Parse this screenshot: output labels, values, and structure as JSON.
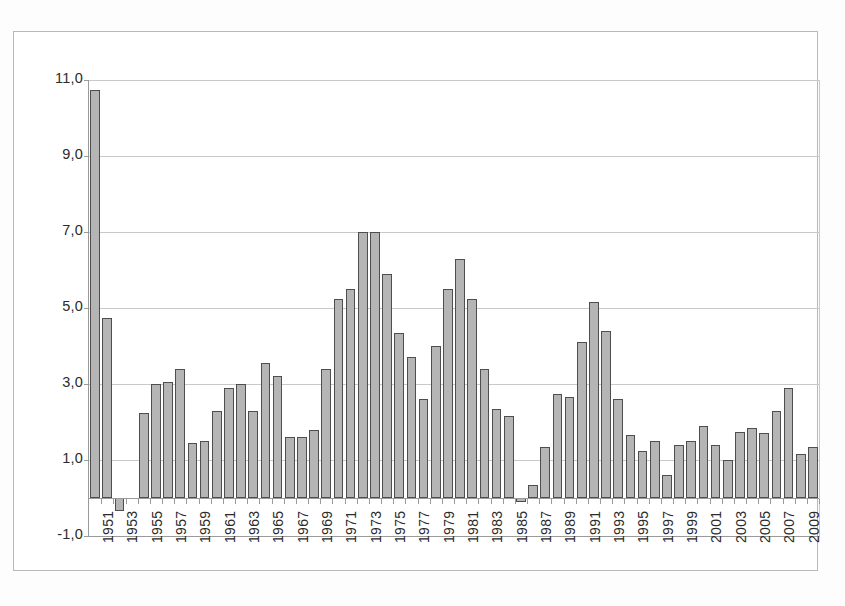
{
  "chart_data": {
    "type": "bar",
    "title": "",
    "subtitle": "",
    "xlabel": "",
    "ylabel": "",
    "ylim": [
      -1.0,
      11.0
    ],
    "ytick_labels": [
      "11,0",
      "9,0",
      "7,0",
      "5,0",
      "3,0",
      "1,0",
      "-1,0"
    ],
    "ytick_values": [
      11.0,
      9.0,
      7.0,
      5.0,
      3.0,
      1.0,
      -1.0
    ],
    "grid": true,
    "legend": "none",
    "decimal_separator": ",",
    "xtick_labels": [
      "1951",
      "1953",
      "1955",
      "1957",
      "1959",
      "1961",
      "1963",
      "1965",
      "1967",
      "1969",
      "1971",
      "1973",
      "1975",
      "1977",
      "1979",
      "1981",
      "1983",
      "1985",
      "1987",
      "1989",
      "1991",
      "1993",
      "1995",
      "1997",
      "1999",
      "2001",
      "2003",
      "2005",
      "2007",
      "2009"
    ],
    "categories": [
      "1951",
      "1952",
      "1953",
      "1954",
      "1955",
      "1956",
      "1957",
      "1958",
      "1959",
      "1960",
      "1961",
      "1962",
      "1963",
      "1964",
      "1965",
      "1966",
      "1967",
      "1968",
      "1969",
      "1970",
      "1971",
      "1972",
      "1973",
      "1974",
      "1975",
      "1976",
      "1977",
      "1978",
      "1979",
      "1980",
      "1981",
      "1982",
      "1983",
      "1984",
      "1985",
      "1986",
      "1987",
      "1988",
      "1989",
      "1990",
      "1991",
      "1992",
      "1993",
      "1994",
      "1995",
      "1996",
      "1997",
      "1998",
      "1999",
      "2000",
      "2001",
      "2002",
      "2003",
      "2004",
      "2005",
      "2006",
      "2007",
      "2008",
      "2009",
      "2010"
    ],
    "values": [
      10.75,
      4.75,
      -0.35,
      0.0,
      2.25,
      3.0,
      3.05,
      3.4,
      1.45,
      1.5,
      2.3,
      2.9,
      3.0,
      2.3,
      3.55,
      3.2,
      1.6,
      1.6,
      1.8,
      3.4,
      5.25,
      5.5,
      7.0,
      7.0,
      5.9,
      4.35,
      3.7,
      2.6,
      4.0,
      5.5,
      6.3,
      5.25,
      3.4,
      2.35,
      2.15,
      -0.1,
      0.35,
      1.35,
      2.75,
      2.65,
      4.1,
      5.15,
      4.4,
      2.6,
      1.65,
      1.25,
      1.5,
      0.6,
      1.4,
      1.5,
      1.9,
      1.4,
      1.0,
      1.75,
      1.85,
      1.7,
      2.3,
      2.9,
      1.15,
      1.35
    ],
    "bar_color": "#b5b5b5",
    "bar_border_color": "#4e4e4e",
    "gridline_color": "#c9c9c9",
    "axis_color": "#9a9a9a"
  }
}
